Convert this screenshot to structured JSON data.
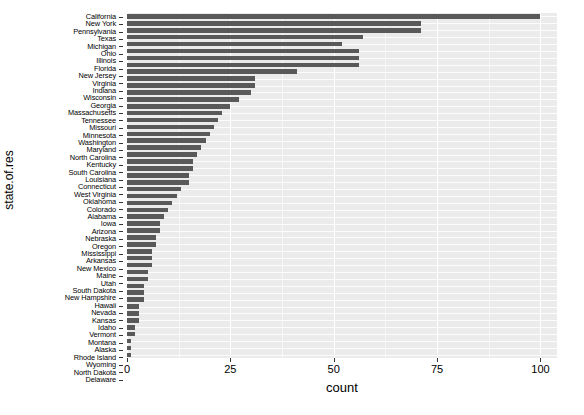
{
  "chart_data": {
    "type": "bar",
    "orientation": "horizontal",
    "title": "",
    "xlabel": "count",
    "ylabel": "state.of.res",
    "xlim": [
      0,
      104
    ],
    "x_ticks": [
      0,
      25,
      50,
      75,
      100
    ],
    "x_tick_labels": [
      "0",
      "25",
      "50",
      "75",
      "100"
    ],
    "grid": true,
    "legend": "none",
    "bar_color": "#595959",
    "panel_color": "#ebebeb",
    "gridline_color": "#ffffff",
    "categories": [
      "California",
      "New York",
      "Pennsylvania",
      "Texas",
      "Michigan",
      "Ohio",
      "Illinois",
      "Florida",
      "New Jersey",
      "Virginia",
      "Indiana",
      "Wisconsin",
      "Georgia",
      "Massachusetts",
      "Tennessee",
      "Missouri",
      "Minnesota",
      "Washington",
      "Maryland",
      "North Carolina",
      "Kentucky",
      "South Carolina",
      "Louisiana",
      "Connecticut",
      "West Virginia",
      "Oklahoma",
      "Colorado",
      "Alabama",
      "Iowa",
      "Arizona",
      "Nebraska",
      "Oregon",
      "Mississippi",
      "Arkansas",
      "New Mexico",
      "Maine",
      "Utah",
      "South Dakota",
      "New Hampshire",
      "Hawaii",
      "Nevada",
      "Kansas",
      "Idaho",
      "Vermont",
      "Montana",
      "Alaska",
      "Rhode Island",
      "Wyoming",
      "North Dakota",
      "Delaware"
    ],
    "values": [
      100,
      71,
      71,
      57,
      52,
      56,
      56,
      56,
      41,
      31,
      31,
      30,
      27,
      25,
      23,
      22,
      21,
      20,
      19,
      18,
      17,
      16,
      16,
      15,
      15,
      13,
      12,
      11,
      10,
      9,
      8,
      8,
      7,
      7,
      6,
      6,
      6,
      5,
      5,
      4,
      4,
      4,
      3,
      3,
      3,
      2,
      2,
      1,
      1,
      1
    ]
  },
  "axis": {
    "y_title": "state.of.res",
    "x_title": "count"
  }
}
